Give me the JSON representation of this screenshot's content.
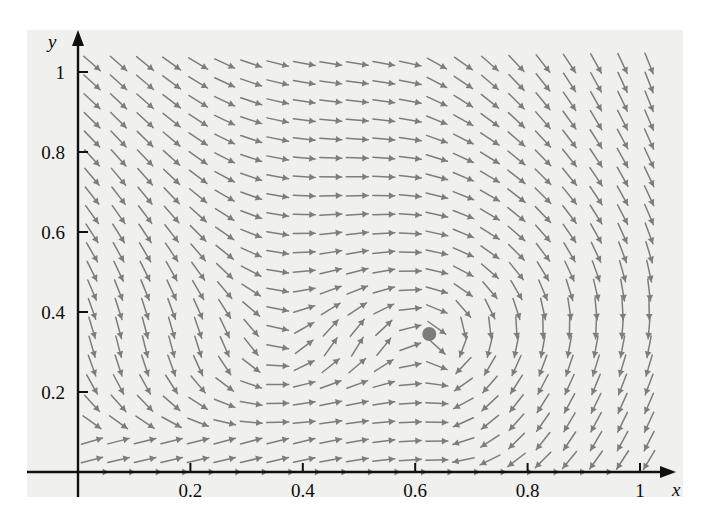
{
  "chart_data": {
    "type": "scatter",
    "title": "",
    "subtitle": "",
    "xlabel": "x",
    "ylabel": "y",
    "xlim": [
      -0.09,
      1.06
    ],
    "ylim": [
      -0.03,
      1.13
    ],
    "grid": false,
    "legend": null,
    "annotations": [
      {
        "name": "equilibrium-point",
        "kind": "filled-dot",
        "x": 0.625,
        "y": 0.345,
        "color": "#7d7d7d",
        "radius_px": 7
      }
    ],
    "xticks": [
      {
        "value": 0.2,
        "label": "0.2"
      },
      {
        "value": 0.4,
        "label": "0.4"
      },
      {
        "value": 0.6,
        "label": "0.6"
      },
      {
        "value": 0.8,
        "label": "0.8"
      },
      {
        "value": 1.0,
        "label": "1"
      }
    ],
    "yticks": [
      {
        "value": 0.2,
        "label": "0.2"
      },
      {
        "value": 0.4,
        "label": "0.4"
      },
      {
        "value": 0.6,
        "label": "0.6"
      },
      {
        "value": 0.8,
        "label": "0.8"
      },
      {
        "value": 1.0,
        "label": "1"
      }
    ],
    "minor_tick_step": 0.04,
    "vector_field": {
      "description": "direction field of a planar autonomous system with a spiral/saddle structure near (0.625, 0.345)",
      "arrow_color": "#7d7d7d",
      "grid_nx": 22,
      "grid_ny": 22,
      "x_start": 0.025,
      "x_step": 0.0472,
      "y_start": 0.03,
      "y_step": 0.0472,
      "model": {
        "form": "u = -k*(x - xe)*? ; rotational field about equilibrium",
        "xe": 0.625,
        "ye": 0.345,
        "a11": 0.0,
        "a12": 1.0,
        "a21": -1.0,
        "a22": 0.0,
        "sink_strength": 0.35
      },
      "arrow_len_px": 22
    }
  },
  "axes": {
    "x_axis_label": "x",
    "y_axis_label": "y",
    "x_axis_color": "#111111",
    "y_axis_color": "#111111"
  },
  "canvas": {
    "background": "#ffffff",
    "panel_background": "#f0f0ef",
    "width": 717,
    "height": 523
  }
}
